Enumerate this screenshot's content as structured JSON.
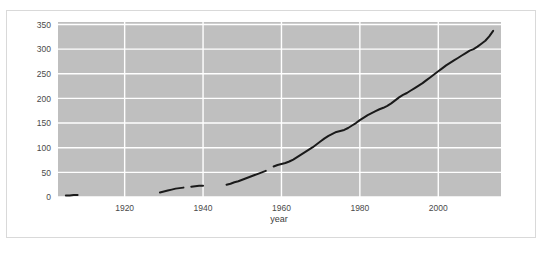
{
  "chart_data": {
    "type": "line",
    "title": "",
    "subtitle": "",
    "xlabel": "year",
    "ylabel": "",
    "xlim": [
      1903,
      2016
    ],
    "ylim": [
      0,
      355
    ],
    "grid": true,
    "legend": null,
    "xticks": [
      1920,
      1940,
      1960,
      1980,
      2000
    ],
    "xticklabels": [
      "1920",
      "1940",
      "1960",
      "1980",
      "2000"
    ],
    "yticks": [
      0,
      50,
      100,
      150,
      200,
      250,
      300,
      350
    ],
    "yticklabels": [
      "0",
      "50",
      "100",
      "150",
      "200",
      "250",
      "300",
      "350"
    ],
    "plot_background": "#bfbfbf",
    "gridline_color": "#ffffff",
    "line_color": "#1a1a1a",
    "panel_background": "#ffffff",
    "panel_border": "#d9d9d9",
    "series": [
      {
        "name": "series-1",
        "x": [
          1905,
          1906,
          1907,
          1908,
          1929,
          1930,
          1931,
          1932,
          1933,
          1934,
          1935,
          1937,
          1938,
          1939,
          1940,
          1946,
          1947,
          1948,
          1949,
          1950,
          1951,
          1952,
          1953,
          1954,
          1955,
          1956,
          1958,
          1959,
          1960,
          1961,
          1962,
          1963,
          1964,
          1965,
          1966,
          1967,
          1968,
          1969,
          1970,
          1971,
          1972,
          1973,
          1974,
          1975,
          1976,
          1977,
          1978,
          1979,
          1980,
          1981,
          1982,
          1983,
          1984,
          1985,
          1986,
          1987,
          1988,
          1989,
          1990,
          1991,
          1992,
          1993,
          1994,
          1995,
          1996,
          1997,
          1998,
          1999,
          2000,
          2001,
          2002,
          2003,
          2004,
          2005,
          2006,
          2007,
          2008,
          2009,
          2010,
          2011,
          2012,
          2013,
          2014
        ],
        "y": [
          3,
          3,
          4,
          4,
          9,
          11,
          13,
          15,
          17,
          18,
          19,
          21,
          22,
          23,
          23,
          25,
          27,
          30,
          32,
          35,
          38,
          41,
          44,
          47,
          50,
          53,
          62,
          65,
          67,
          69,
          72,
          76,
          81,
          86,
          91,
          96,
          101,
          107,
          113,
          119,
          124,
          128,
          132,
          134,
          136,
          140,
          145,
          150,
          156,
          161,
          166,
          170,
          174,
          178,
          181,
          185,
          190,
          196,
          202,
          207,
          211,
          216,
          221,
          226,
          231,
          237,
          243,
          249,
          255,
          261,
          267,
          272,
          277,
          282,
          287,
          292,
          297,
          300,
          305,
          311,
          317,
          326,
          337
        ],
        "gaps": [
          [
            1908,
            1929
          ],
          [
            1935,
            1937
          ],
          [
            1940,
            1946
          ],
          [
            1956,
            1958
          ]
        ]
      }
    ]
  },
  "caption": {
    "text": ""
  }
}
